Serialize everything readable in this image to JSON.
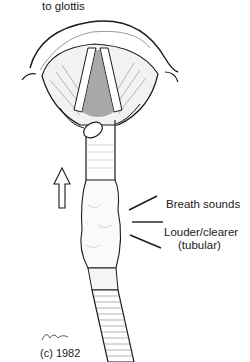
{
  "figure": {
    "title_fragment": "to glottis",
    "labels": {
      "breath_sounds": "Breath sounds",
      "louder": "Louder/clearer",
      "tubular": "(tubular)"
    },
    "signature": "Tagrin",
    "copyright": "(c) 1982",
    "arrow_direction": "up",
    "colors": {
      "ink": "#1a1a1a",
      "background": "#ffffff"
    }
  }
}
